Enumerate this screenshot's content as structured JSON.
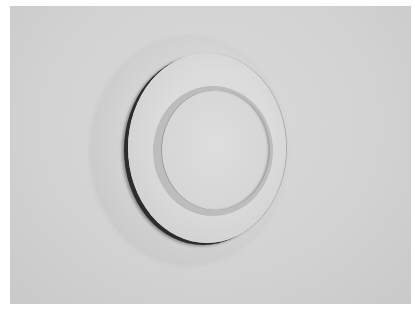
{
  "image": {
    "description": "Grayscale photograph of a round air diffuser mounted on a flat surface",
    "subject": "circular air diffuser",
    "components": [
      "outer mounting ring (halo)",
      "middle plate",
      "inner cap"
    ],
    "colors": {
      "border": "#ffffff",
      "background": "#d2d2d2",
      "shadow_gap": "#2c2c2c",
      "cap": "#d8d8d8"
    }
  }
}
